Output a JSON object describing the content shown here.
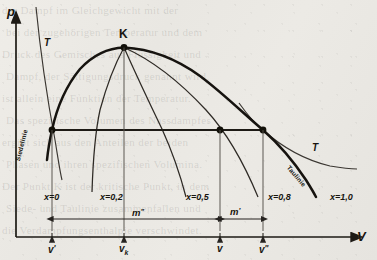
{
  "figure": {
    "kind": "p-v diagram (Nassdampfgebiet)",
    "axes": {
      "y_label": "p",
      "x_label": "V"
    },
    "critical_point": {
      "label": "K"
    },
    "curve_labels": {
      "boiling_line": "Siedelinie",
      "dew_line": "Taulinie",
      "isotherm_left": "T",
      "isotherm_right": "T"
    },
    "quality_labels": [
      {
        "id": "x0",
        "text": "x=0"
      },
      {
        "id": "x02",
        "text": "x=0,2"
      },
      {
        "id": "x05",
        "text": "x=0,5"
      },
      {
        "id": "x08",
        "text": "x=0,8"
      },
      {
        "id": "x10",
        "text": "x=1,0"
      }
    ],
    "volume_ticks": [
      {
        "id": "v_prime",
        "html": "v<sup>'</sup>"
      },
      {
        "id": "v_k",
        "html": "v<sub>k</sub>"
      },
      {
        "id": "v",
        "html": "v"
      },
      {
        "id": "v_dprime",
        "html": "v<sup>''</sup>"
      }
    ],
    "mass_brackets": [
      {
        "id": "m_dprime",
        "html": "m<sup>''</sup>"
      },
      {
        "id": "m_prime",
        "html": "m<sup>'</sup>"
      }
    ],
    "colors": {
      "ink": "#17150f",
      "line": "#2a2722",
      "paper": "#e9e7e2"
    }
  },
  "chart_data": {
    "type": "line",
    "title": "",
    "xlabel": "V",
    "ylabel": "p",
    "grid": false,
    "legend": "none",
    "annotations": [
      "K",
      "Siedelinie",
      "Taulinie",
      "T",
      "T",
      "m''",
      "m'"
    ],
    "series": [
      {
        "name": "Siedelinie (x=0)",
        "note": "left branch of the saturation dome, rises from lower-left to the critical point K",
        "points": [
          [
            52,
            130
          ],
          [
            60,
            104
          ],
          [
            72,
            79
          ],
          [
            88,
            62
          ],
          [
            105,
            52
          ],
          [
            124,
            48
          ]
        ]
      },
      {
        "name": "Taulinie (x=1,0)",
        "note": "right branch of the saturation dome, falls from K to lower-right",
        "points": [
          [
            124,
            48
          ],
          [
            160,
            56
          ],
          [
            198,
            74
          ],
          [
            232,
            97
          ],
          [
            263,
            130
          ],
          [
            290,
            168
          ],
          [
            305,
            196
          ]
        ]
      },
      {
        "name": "x=0,2",
        "points": [
          [
            124,
            48
          ],
          [
            112,
            70
          ],
          [
            101,
            104
          ],
          [
            95,
            145
          ],
          [
            93,
            192
          ]
        ]
      },
      {
        "name": "x=0,5",
        "points": [
          [
            124,
            48
          ],
          [
            140,
            80
          ],
          [
            158,
            120
          ],
          [
            172,
            160
          ],
          [
            184,
            198
          ]
        ]
      },
      {
        "name": "x=0,8",
        "points": [
          [
            124,
            48
          ],
          [
            172,
            70
          ],
          [
            212,
            110
          ],
          [
            240,
            160
          ],
          [
            258,
            198
          ]
        ]
      },
      {
        "name": "isotherm T (left, steep)",
        "points": [
          [
            37,
            8
          ],
          [
            41,
            45
          ],
          [
            47,
            90
          ],
          [
            55,
            140
          ],
          [
            61,
            178
          ]
        ]
      },
      {
        "name": "isotherm T (right, flat)",
        "points": [
          [
            239,
            103
          ],
          [
            263,
            130
          ],
          [
            290,
            152
          ],
          [
            320,
            164
          ],
          [
            355,
            169
          ]
        ]
      },
      {
        "name": "isobar (horizontal tie line)",
        "points": [
          [
            52,
            130
          ],
          [
            263,
            130
          ]
        ]
      }
    ],
    "marked_points": [
      {
        "label": "K",
        "x": 124,
        "y": 48,
        "meaning": "critical point"
      },
      {
        "label": "v'",
        "x": 52,
        "y": 130,
        "meaning": "saturated liquid"
      },
      {
        "label": "v",
        "x": 220,
        "y": 130,
        "meaning": "wet steam state"
      },
      {
        "label": "v''",
        "x": 263,
        "y": 130,
        "meaning": "saturated vapour"
      }
    ],
    "x_tick_positions": {
      "v_prime": 52,
      "v_k": 124,
      "v": 220,
      "v_dprime": 263
    }
  },
  "ghost_text": {
    "lines": [
      "der Dampf im Gleichgewicht mit der",
      "bei der zugehörigen Temperatur und dem",
      "Druck des Gemisches aus Flüssigkeit und",
      "Dampf, der Sättigungsdruck genannt wird,",
      "ist allein eine Funktion der Temperatur.",
      "Das spezifische Volumen des Nassdampfes",
      "ergibt sich aus den Anteilen der beiden",
      "Phasen und ihren spezifischen Volumina.",
      "Der Punkt K ist der kritische Punkt, in dem",
      "Siede- und Taulinie zusammenfallen und",
      "die Verdampfungsenthalpie verschwindet."
    ]
  }
}
